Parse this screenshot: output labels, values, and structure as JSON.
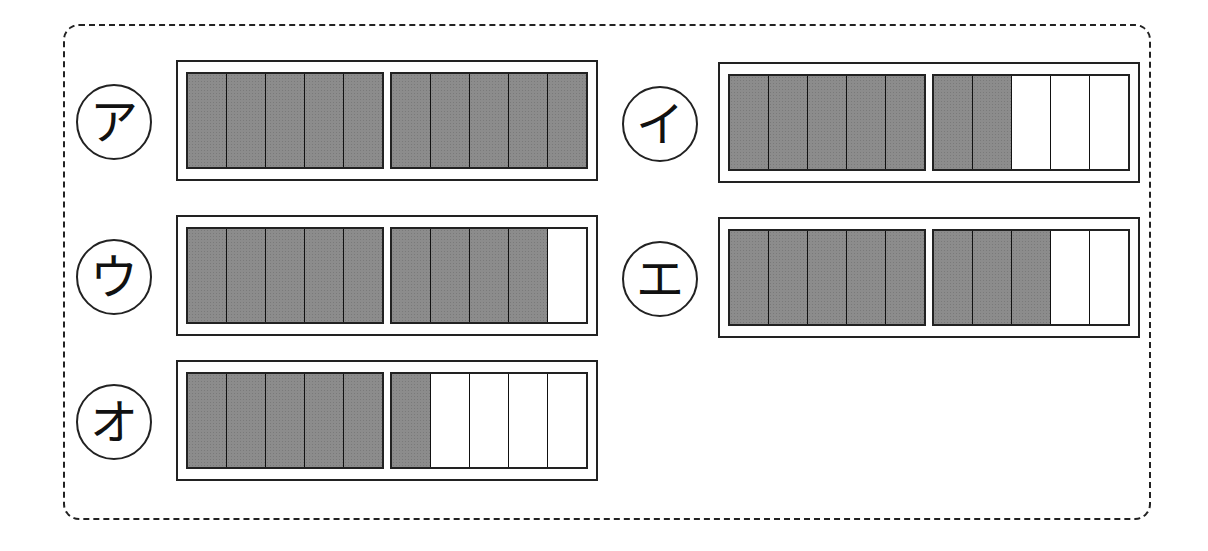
{
  "colors": {
    "shaded": "#8c8c8c",
    "empty": "#ffffff",
    "stroke": "#222222"
  },
  "options": [
    {
      "label": "ア",
      "shaded": 10,
      "total": 10
    },
    {
      "label": "イ",
      "shaded": 7,
      "total": 10
    },
    {
      "label": "ウ",
      "shaded": 9,
      "total": 10
    },
    {
      "label": "エ",
      "shaded": 8,
      "total": 10
    },
    {
      "label": "オ",
      "shaded": 6,
      "total": 10
    }
  ]
}
